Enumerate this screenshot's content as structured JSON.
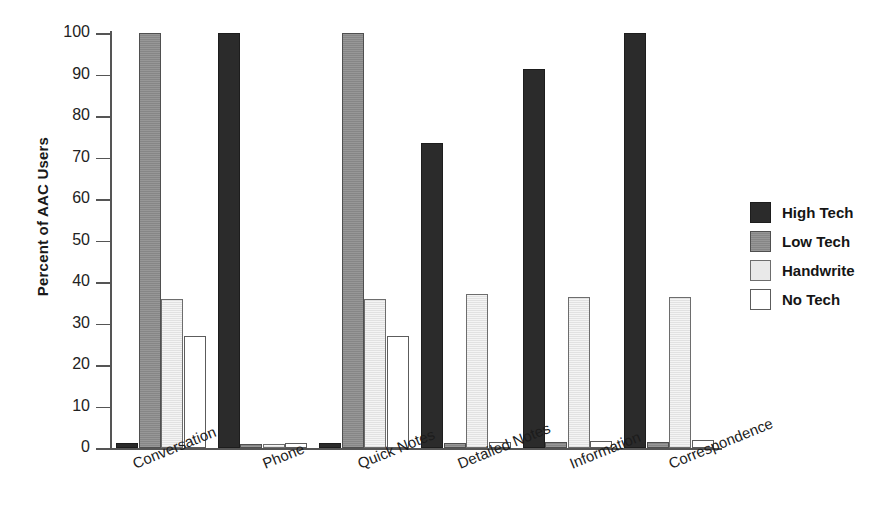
{
  "chart_data": {
    "type": "bar",
    "title": "",
    "xlabel": "",
    "ylabel": "Percent of AAC Users",
    "ylim": [
      0,
      100
    ],
    "yticks": [
      0,
      10,
      20,
      30,
      40,
      50,
      60,
      70,
      80,
      90,
      100
    ],
    "ytick_labels": [
      "0",
      "10",
      "20",
      "30",
      "40",
      "50",
      "60",
      "70",
      "80",
      "90",
      "100"
    ],
    "grid": false,
    "legend_position": "right",
    "categories": [
      "Conversation",
      "Phone",
      "Quick Notes",
      "Detailed Notes",
      "Information",
      "Correspondence"
    ],
    "series": [
      {
        "name": "High Tech",
        "color": "#2b2b2b",
        "values": [
          1.3,
          100.0,
          1.3,
          73.4,
          91.3,
          100.0
        ]
      },
      {
        "name": "Low Tech",
        "color": "#8d8d8d",
        "values": [
          100.0,
          1.0,
          100.0,
          1.3,
          1.5,
          1.5
        ]
      },
      {
        "name": "Handwrite",
        "color": "#e9e9e9",
        "values": [
          36.0,
          1.0,
          36.0,
          37.0,
          36.4,
          36.4
        ]
      },
      {
        "name": "No Tech",
        "color": "#ffffff",
        "values": [
          27.0,
          1.2,
          27.0,
          1.5,
          1.6,
          1.9
        ]
      }
    ]
  },
  "legend": {
    "items": [
      {
        "label": "High Tech",
        "key": "high-tech"
      },
      {
        "label": "Low Tech",
        "key": "low-tech"
      },
      {
        "label": "Handwrite",
        "key": "handwrite"
      },
      {
        "label": "No Tech",
        "key": "no-tech"
      }
    ]
  }
}
